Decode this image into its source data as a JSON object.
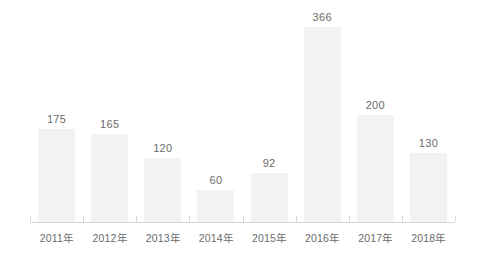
{
  "chart_data": {
    "type": "bar",
    "title": "",
    "subtitle": "",
    "xlabel": "",
    "ylabel": "",
    "categories": [
      "2011年",
      "2012年",
      "2013年",
      "2014年",
      "2015年",
      "2016年",
      "2017年",
      "2018年"
    ],
    "values": [
      175,
      165,
      120,
      60,
      92,
      366,
      200,
      130
    ],
    "value_labels": [
      "175",
      "165",
      "120",
      "60",
      "92",
      "366",
      "200",
      "130"
    ],
    "ylim": [
      0,
      366
    ],
    "grid": false,
    "legend": false,
    "legend_position": "none",
    "annotations": [],
    "colors": {
      "bar_fill": "#f2f2f2",
      "axis_line": "#d8d8d8",
      "label_text": "#6b6b6b",
      "background": "#ffffff"
    }
  }
}
